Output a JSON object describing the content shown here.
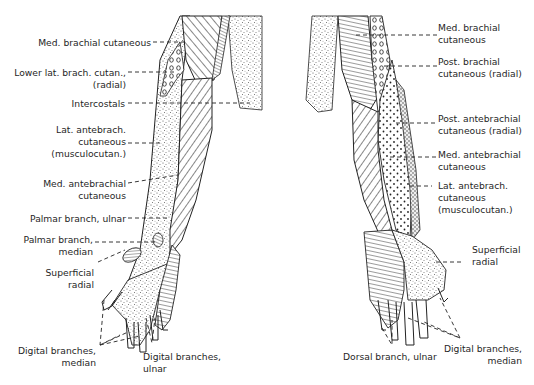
{
  "figure": {
    "views": [
      {
        "name": "anterior",
        "labels": [
          {
            "id": "med-brachial-cutaneous",
            "lines": [
              "Med. brachial cutaneous"
            ]
          },
          {
            "id": "lower-lat-brach-cutan",
            "lines": [
              "Lower lat. brach. cutan.,",
              "(radial)"
            ]
          },
          {
            "id": "intercostals",
            "lines": [
              "Intercostals"
            ]
          },
          {
            "id": "lat-antebrach-cutaneous",
            "lines": [
              "Lat. antebrach.",
              "cutaneous",
              "(musculocutan.)"
            ]
          },
          {
            "id": "med-antebrachial-cutaneous",
            "lines": [
              "Med. antebrachial",
              "cutaneous"
            ]
          },
          {
            "id": "palmar-branch-ulnar",
            "lines": [
              "Palmar branch, ulnar"
            ]
          },
          {
            "id": "palmar-branch-median",
            "lines": [
              "Palmar branch,",
              "median"
            ]
          },
          {
            "id": "superficial-radial",
            "lines": [
              "Superficial",
              "radial"
            ]
          },
          {
            "id": "digital-branches-median",
            "lines": [
              "Digital branches,",
              "median"
            ]
          },
          {
            "id": "digital-branches-ulnar",
            "lines": [
              "Digital branches,",
              "ulnar"
            ]
          }
        ]
      },
      {
        "name": "posterior",
        "labels": [
          {
            "id": "med-brachial-cutaneous",
            "lines": [
              "Med. brachial",
              "cutaneous"
            ]
          },
          {
            "id": "post-brachial-cutaneous",
            "lines": [
              "Post. brachial",
              "cutaneous (radial)"
            ]
          },
          {
            "id": "post-antebrachial-cutaneous",
            "lines": [
              "Post. antebrachial",
              "cutaneous (radial)"
            ]
          },
          {
            "id": "med-antebrachial-cutaneous",
            "lines": [
              "Med. antebrachial",
              "cutaneous"
            ]
          },
          {
            "id": "lat-antebrach-cutaneous",
            "lines": [
              "Lat. antebrach.",
              "cutaneous",
              "(musculocutan.)"
            ]
          },
          {
            "id": "superficial-radial",
            "lines": [
              "Superficial",
              "radial"
            ]
          },
          {
            "id": "dorsal-branch-ulnar",
            "lines": [
              "Dorsal branch, ulnar"
            ]
          },
          {
            "id": "digital-branches-median",
            "lines": [
              "Digital branches,",
              "median"
            ]
          }
        ]
      }
    ]
  }
}
